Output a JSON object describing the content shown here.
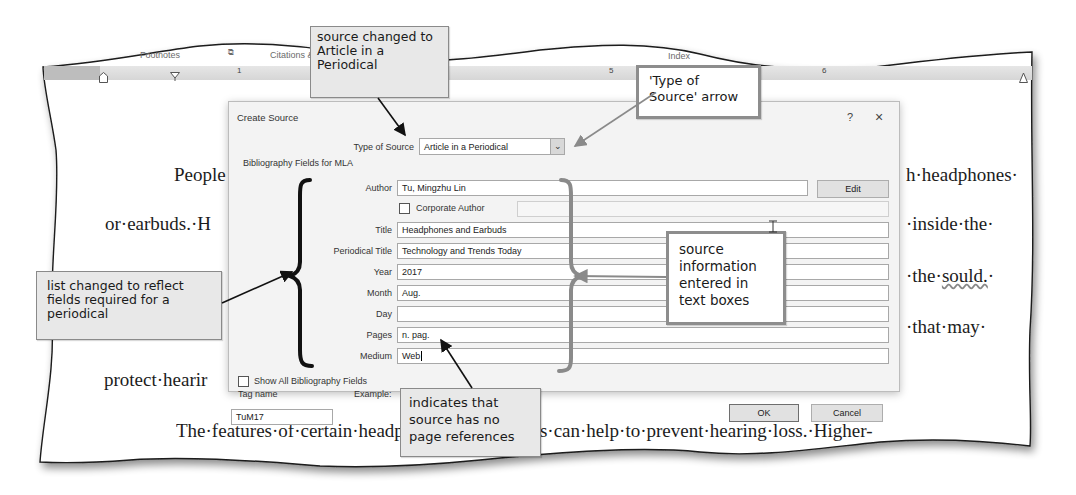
{
  "ribbon": {
    "groups": [
      "Footnotes",
      "Citations & Bibliography",
      "Index"
    ],
    "launcher_icon": "dialog-launcher-icon"
  },
  "ruler": {
    "numbers": [
      "1",
      "2",
      "3",
      "4",
      "5",
      "6"
    ]
  },
  "document": {
    "lines": [
      "People",
      "h·headphones·",
      "or·earbuds.·H",
      "·inside·the·",
      "ear·canal.·Wi",
      "·the·",
      "sould.",
      "·",
      "...to·bl",
      "·that·may·",
      "protect·hearir",
      "The·features·of·certain·headphones·and·earbuds·can·help·to·prevent·hearing·loss.·Higher-"
    ]
  },
  "dialog": {
    "title": "Create Source",
    "help_label": "?",
    "close_label": "×",
    "type_of_source_label": "Type of Source",
    "type_of_source_value": "Article in a Periodical",
    "section_header": "Bibliography Fields for MLA",
    "fields": [
      {
        "label": "Author",
        "value": "Tu, Mingzhu Lin"
      },
      {
        "label": "Title",
        "value": "Headphones and Earbuds"
      },
      {
        "label": "Periodical Title",
        "value": "Technology and Trends Today"
      },
      {
        "label": "Year",
        "value": "2017"
      },
      {
        "label": "Month",
        "value": "Aug."
      },
      {
        "label": "Day",
        "value": ""
      },
      {
        "label": "Pages",
        "value": "n. pag."
      },
      {
        "label": "Medium",
        "value": "Web"
      }
    ],
    "edit_button": "Edit",
    "corporate_author_label": "Corporate Author",
    "corporate_author_checked": false,
    "show_all_label": "Show All Bibliography Fields",
    "show_all_checked": false,
    "tag_name_label": "Tag name",
    "tag_name_value": "TuM17",
    "example_label": "Example:",
    "ok_button": "OK",
    "cancel_button": "Cancel"
  },
  "callouts": {
    "source_changed": "source changed to Article in a Periodical",
    "type_arrow": "'Type of Source' arrow",
    "list_changed": "list changed to reflect fields required for a periodical",
    "source_info": "source information entered in text boxes",
    "no_pages": "indicates that source has no page references"
  }
}
